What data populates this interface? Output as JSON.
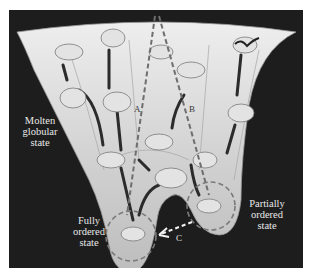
{
  "figure": {
    "type": "protein folding energy landscape funnel",
    "labels": {
      "molten": [
        "Molten",
        "globular",
        "state"
      ],
      "fully": [
        "Fully",
        "ordered",
        "state"
      ],
      "partially": [
        "Partially",
        "ordered",
        "state"
      ]
    },
    "pathways": {
      "a": "A",
      "b": "B",
      "c": "C"
    },
    "colors": {
      "background": "#1d1d1d",
      "funnel_surface": "#d8d8d8",
      "dashed_path": "#6e6e6e",
      "arrow_c": "#f2f2f2",
      "label_text": "#e8e8e8"
    }
  }
}
